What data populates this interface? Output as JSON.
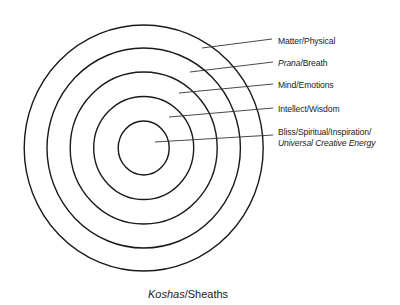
{
  "diagram": {
    "title": "Koshas/Sheaths",
    "title_italic_part": "Koshas",
    "title_plain_part": "/Sheaths",
    "center": {
      "x": 143.7,
      "y": 148
    },
    "stroke_color": "#1a1a1a",
    "rings": [
      {
        "name": "Matter/Physical",
        "rx": 119.5,
        "ry": 123
      },
      {
        "name": "Prana/Breath",
        "rx": 96.7,
        "ry": 100
      },
      {
        "name": "Mind/Emotions",
        "rx": 73.5,
        "ry": 76
      },
      {
        "name": "Intellect/Wisdom",
        "rx": 50,
        "ry": 51.5
      },
      {
        "name": "Bliss/Spiritual/Inspiration/Universal Creative Energy",
        "rx": 25.5,
        "ry": 27
      }
    ],
    "labels": [
      {
        "italic": "",
        "plain": "Matter/Physical",
        "line2": ""
      },
      {
        "italic": "Prana",
        "plain": "/Breath",
        "line2": ""
      },
      {
        "italic": "",
        "plain": "Mind/Emotions",
        "line2": ""
      },
      {
        "italic": "",
        "plain": "Intellect/Wisdom",
        "line2": ""
      },
      {
        "italic": "",
        "plain": "Bliss/Spiritual/Inspiration/",
        "line2": "Universal Creative Energy"
      }
    ]
  }
}
